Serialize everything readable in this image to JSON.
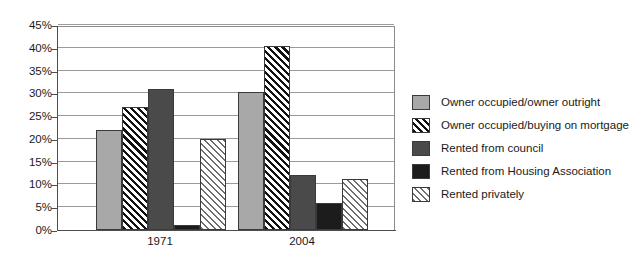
{
  "chart_data": {
    "type": "bar",
    "title": "",
    "subtitle": "",
    "xlabel": "",
    "ylabel": "",
    "categories": [
      "1971",
      "2004"
    ],
    "ylim": [
      0,
      45
    ],
    "ytick_values": [
      0,
      5,
      10,
      15,
      20,
      25,
      30,
      35,
      40,
      45
    ],
    "ytick_labels": [
      "0%",
      "5%",
      "10%",
      "15%",
      "20%",
      "25%",
      "30%",
      "35%",
      "40%",
      "45%"
    ],
    "grid": true,
    "legend_position": "right",
    "series": [
      {
        "name": "Owner occupied/owner outright",
        "values": [
          22,
          30.3
        ],
        "fill": "solid-light",
        "color": "#a8a8a8"
      },
      {
        "name": "Owner occupied/buying on mortgage",
        "values": [
          27,
          40.5
        ],
        "fill": "hatch-dark",
        "color": "#111111"
      },
      {
        "name": "Rented from council",
        "values": [
          31,
          12
        ],
        "fill": "solid-mid",
        "color": "#4a4a4a"
      },
      {
        "name": "Rented from Housing Association",
        "values": [
          1,
          6
        ],
        "fill": "solid-dark",
        "color": "#1c1c1c"
      },
      {
        "name": "Rented privately",
        "values": [
          20,
          11.2
        ],
        "fill": "hatch-light",
        "color": "#6e6e6e"
      }
    ]
  }
}
